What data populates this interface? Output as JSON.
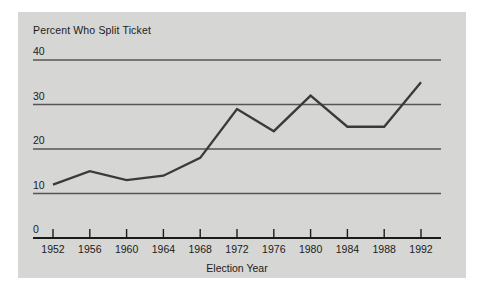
{
  "figure": {
    "background_color": "#ffffff",
    "panel_color": "#d6d6d4",
    "line_color": "#3a3a3a",
    "axis_color": "#1b1b1b",
    "grid_color": "#555555"
  },
  "chart_data": {
    "type": "line",
    "title": "Percent Who Split Ticket",
    "xlabel": "Election Year",
    "ylabel": "",
    "categories": [
      "1952",
      "1956",
      "1960",
      "1964",
      "1968",
      "1972",
      "1976",
      "1980",
      "1984",
      "1988",
      "1992"
    ],
    "x": [
      1952,
      1956,
      1960,
      1964,
      1968,
      1972,
      1976,
      1980,
      1984,
      1988,
      1992
    ],
    "values": [
      12,
      15,
      13,
      14,
      18,
      29,
      24,
      32,
      25,
      25,
      35
    ],
    "series": [
      {
        "name": "Percent Who Split Ticket",
        "values": [
          12,
          15,
          13,
          14,
          18,
          29,
          24,
          32,
          25,
          25,
          35
        ]
      }
    ],
    "ylim": [
      0,
      40
    ],
    "xlim": [
      1952,
      1992
    ],
    "yticks": [
      0,
      10,
      20,
      30,
      40
    ],
    "ytick_labels": [
      "0",
      "10",
      "20",
      "30",
      "40"
    ],
    "grid": "horizontal",
    "legend": "none"
  }
}
